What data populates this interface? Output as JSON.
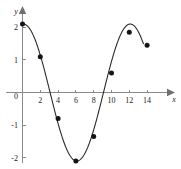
{
  "chart_data": {
    "type": "scatter",
    "title": "",
    "subtitle": "",
    "xlabel": "x",
    "ylabel": "y",
    "xlim": [
      -0.5,
      15.2
    ],
    "ylim": [
      -2.6,
      2.55
    ],
    "grid": false,
    "legend": null,
    "x_ticks": [
      0,
      2,
      4,
      6,
      8,
      10,
      12,
      14
    ],
    "x_tick_labels": [
      "0",
      "2",
      "4",
      "6",
      "8",
      "10",
      "12",
      "14"
    ],
    "y_ticks": [
      2,
      1,
      0,
      -1,
      -2
    ],
    "y_tick_labels": [
      "2",
      "1",
      "0",
      "-1",
      "-2"
    ],
    "origin_label": "0",
    "x": [
      0,
      2,
      4,
      6,
      8,
      10,
      12,
      14
    ],
    "values": [
      2.1,
      1.1,
      -0.8,
      -2.1,
      -1.35,
      0.6,
      1.85,
      1.45
    ],
    "points": [
      {
        "x": 0,
        "y": 2.1
      },
      {
        "x": 2,
        "y": 1.1
      },
      {
        "x": 4,
        "y": -0.8
      },
      {
        "x": 6,
        "y": -2.1
      },
      {
        "x": 8,
        "y": -1.35
      },
      {
        "x": 10,
        "y": 0.6
      },
      {
        "x": 12,
        "y": 1.85
      },
      {
        "x": 14,
        "y": 1.45
      }
    ],
    "series": [
      {
        "name": "data points",
        "type": "scatter",
        "marker": "filled-circle",
        "color": "#141414",
        "x": [
          0,
          2,
          4,
          6,
          8,
          10,
          12,
          14
        ],
        "values": [
          2.1,
          1.1,
          -0.8,
          -2.1,
          -1.35,
          0.6,
          1.85,
          1.45
        ]
      },
      {
        "name": "fitted sinusoidal curve",
        "type": "line",
        "color": "#2b2b2b",
        "model": "y = 2.1*cos(2*pi*(x-0.1)/12)",
        "x_range": [
          0,
          13.6
        ],
        "amplitude": 2.1,
        "period": 12,
        "phase_shift": 0.1,
        "vertical_shift": 0,
        "maximum": {
          "x": 12.1,
          "y": 2.05
        },
        "minimum": {
          "x": 6.1,
          "y": -2.15
        },
        "zero_crossings": [
          3.0,
          9.1
        ]
      }
    ],
    "axis_style": {
      "arrows": true,
      "x_axis_color": "#8a8a8a",
      "y_axis_color": "#8a8a8a",
      "curve_color": "#2b2b2b",
      "marker_color": "#141414"
    }
  }
}
